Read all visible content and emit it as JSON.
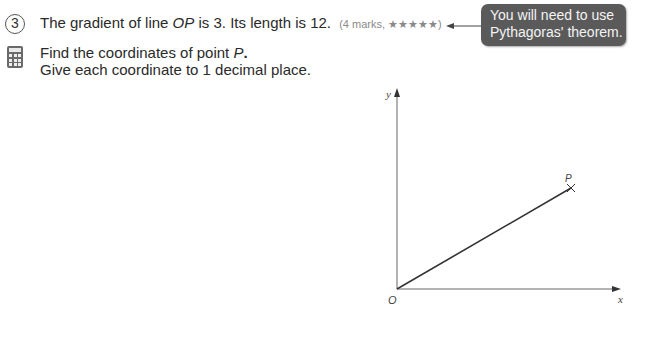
{
  "question": {
    "number": "3",
    "line1_prefix": "The gradient of line ",
    "line1_var": "OP",
    "line1_suffix": " is 3. Its length is 12.",
    "marks": "(4 marks, ★★★★★)",
    "line2_prefix": "Find the coordinates of point ",
    "line2_var": "P",
    "line2_suffix": ".",
    "line3": "Give each coordinate to 1 decimal place."
  },
  "hint": {
    "text_line1": "You will need to use",
    "text_line2": "Pythagoras' theorem."
  },
  "icons": {
    "calculator": "calculator-icon"
  },
  "diagram": {
    "x_axis_label": "x",
    "y_axis_label": "y",
    "origin_label": "O",
    "point_label": "P",
    "origin_px": [
      397,
      289
    ],
    "point_px": [
      571,
      188
    ],
    "x_axis_end_px": [
      620,
      289
    ],
    "y_axis_end_px": [
      397,
      90
    ]
  }
}
